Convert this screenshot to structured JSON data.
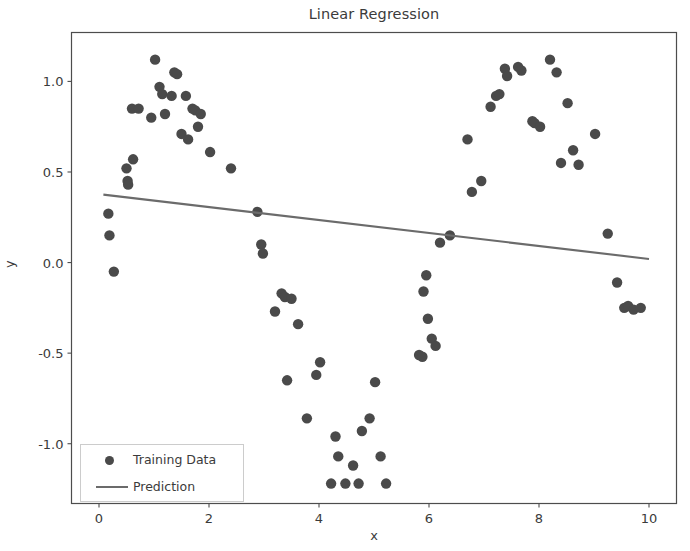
{
  "chart_data": {
    "type": "scatter",
    "title": "Linear Regression",
    "xlabel": "x",
    "ylabel": "y",
    "xlim": [
      -0.5,
      10.5
    ],
    "ylim": [
      -1.33,
      1.27
    ],
    "xticks": [
      0,
      2,
      4,
      6,
      8,
      10
    ],
    "yticks": [
      1.0,
      0.5,
      0.0,
      -0.5,
      -1.0
    ],
    "ytick_labels": [
      "1.0",
      "0.5",
      "0.0",
      "-0.5",
      "-1.0"
    ],
    "xtick_labels": [
      "0",
      "2",
      "4",
      "6",
      "8",
      "10"
    ],
    "grid": false,
    "legend_position": "lower left",
    "marker_color": "#4a4a4a",
    "line_color": "#6b6b6b",
    "axes_color": "#4d4d4d",
    "background_color": "#ffffff",
    "series": [
      {
        "name": "Training Data",
        "type": "scatter",
        "marker": "circle",
        "color": "#4a4a4a",
        "points": [
          [
            0.17,
            0.27
          ],
          [
            0.19,
            0.15
          ],
          [
            0.27,
            -0.05
          ],
          [
            0.5,
            0.52
          ],
          [
            0.52,
            0.45
          ],
          [
            0.53,
            0.43
          ],
          [
            0.6,
            0.85
          ],
          [
            0.62,
            0.57
          ],
          [
            0.72,
            0.85
          ],
          [
            0.95,
            0.8
          ],
          [
            1.02,
            1.12
          ],
          [
            1.1,
            0.97
          ],
          [
            1.15,
            0.93
          ],
          [
            1.2,
            0.82
          ],
          [
            1.32,
            0.92
          ],
          [
            1.37,
            1.05
          ],
          [
            1.42,
            1.04
          ],
          [
            1.5,
            0.71
          ],
          [
            1.58,
            0.92
          ],
          [
            1.62,
            0.68
          ],
          [
            1.7,
            0.85
          ],
          [
            1.75,
            0.84
          ],
          [
            1.8,
            0.75
          ],
          [
            1.85,
            0.82
          ],
          [
            2.02,
            0.61
          ],
          [
            2.4,
            0.52
          ],
          [
            2.88,
            0.28
          ],
          [
            2.95,
            0.1
          ],
          [
            2.98,
            0.05
          ],
          [
            3.2,
            -0.27
          ],
          [
            3.32,
            -0.17
          ],
          [
            3.38,
            -0.19
          ],
          [
            3.5,
            -0.2
          ],
          [
            3.62,
            -0.34
          ],
          [
            3.42,
            -0.65
          ],
          [
            3.78,
            -0.86
          ],
          [
            3.95,
            -0.62
          ],
          [
            4.02,
            -0.55
          ],
          [
            4.22,
            -1.22
          ],
          [
            4.3,
            -0.96
          ],
          [
            4.35,
            -1.07
          ],
          [
            4.48,
            -1.22
          ],
          [
            4.62,
            -1.12
          ],
          [
            4.72,
            -1.22
          ],
          [
            4.78,
            -0.93
          ],
          [
            4.92,
            -0.86
          ],
          [
            5.02,
            -0.66
          ],
          [
            5.12,
            -1.07
          ],
          [
            5.22,
            -1.22
          ],
          [
            5.82,
            -0.51
          ],
          [
            5.88,
            -0.52
          ],
          [
            5.9,
            -0.16
          ],
          [
            5.95,
            -0.07
          ],
          [
            5.98,
            -0.31
          ],
          [
            6.05,
            -0.42
          ],
          [
            6.12,
            -0.46
          ],
          [
            6.2,
            0.11
          ],
          [
            6.38,
            0.15
          ],
          [
            6.7,
            0.68
          ],
          [
            6.78,
            0.39
          ],
          [
            6.95,
            0.45
          ],
          [
            7.12,
            0.86
          ],
          [
            7.22,
            0.92
          ],
          [
            7.28,
            0.93
          ],
          [
            7.38,
            1.07
          ],
          [
            7.42,
            1.03
          ],
          [
            7.62,
            1.08
          ],
          [
            7.68,
            1.06
          ],
          [
            7.88,
            0.78
          ],
          [
            7.92,
            0.77
          ],
          [
            8.02,
            0.75
          ],
          [
            8.2,
            1.12
          ],
          [
            8.32,
            1.05
          ],
          [
            8.4,
            0.55
          ],
          [
            8.52,
            0.88
          ],
          [
            8.62,
            0.62
          ],
          [
            8.72,
            0.54
          ],
          [
            9.02,
            0.71
          ],
          [
            9.25,
            0.16
          ],
          [
            9.42,
            -0.11
          ],
          [
            9.55,
            -0.25
          ],
          [
            9.62,
            -0.24
          ],
          [
            9.72,
            -0.26
          ],
          [
            9.85,
            -0.25
          ]
        ]
      },
      {
        "name": "Prediction",
        "type": "line",
        "color": "#6b6b6b",
        "x": [
          0.08,
          10.0
        ],
        "y": [
          0.375,
          0.02
        ],
        "slope": -0.0358,
        "intercept": 0.378
      }
    ]
  },
  "legend": {
    "items": [
      {
        "label": "Training Data",
        "symbol": "dot"
      },
      {
        "label": "Prediction",
        "symbol": "line"
      }
    ]
  }
}
